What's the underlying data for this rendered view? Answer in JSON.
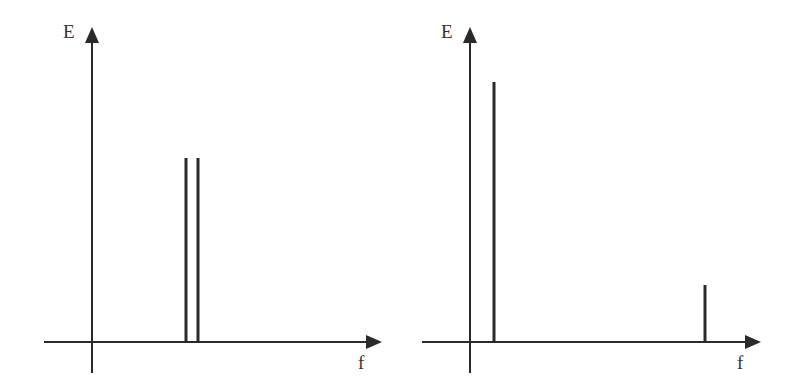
{
  "diagrams": [
    {
      "id": "left",
      "y_label": "E",
      "x_label": "f",
      "origin": [
        92,
        342
      ],
      "x_axis": {
        "start": 44,
        "end": 382
      },
      "y_axis": {
        "top": 27,
        "bottom": 373
      },
      "spikes": [
        {
          "x": 186,
          "top": 158
        },
        {
          "x": 198,
          "top": 158
        }
      ]
    },
    {
      "id": "right",
      "y_label": "E",
      "x_label": "f",
      "origin": [
        470,
        342
      ],
      "x_axis": {
        "start": 422,
        "end": 761
      },
      "y_axis": {
        "top": 27,
        "bottom": 373
      },
      "spikes": [
        {
          "x": 494,
          "top": 82
        },
        {
          "x": 705,
          "top": 285
        }
      ]
    }
  ],
  "colors": {
    "line": "#2a2a2a",
    "label": "#333333"
  }
}
